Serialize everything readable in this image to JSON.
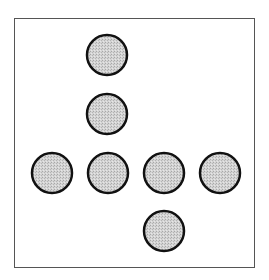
{
  "diagram": {
    "type": "peg-solitaire-pattern",
    "frame": {
      "x": 14,
      "y": 18,
      "width": 241,
      "height": 250,
      "stroke": "#555555"
    },
    "peg_style": {
      "radius": 20,
      "fill": "#cfcfcf",
      "stroke": "#111111",
      "stroke_width": 2.5
    },
    "pegs": [
      {
        "cx": 107,
        "cy": 55
      },
      {
        "cx": 107,
        "cy": 114
      },
      {
        "cx": 52,
        "cy": 173
      },
      {
        "cx": 108,
        "cy": 173
      },
      {
        "cx": 164,
        "cy": 173
      },
      {
        "cx": 220,
        "cy": 173
      },
      {
        "cx": 164,
        "cy": 231
      }
    ]
  }
}
